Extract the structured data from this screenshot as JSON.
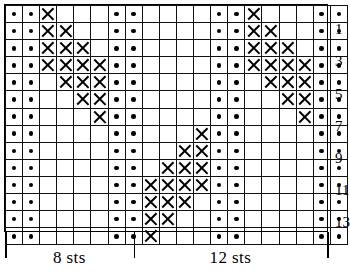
{
  "chart_data": {
    "type": "table",
    "columns": 20,
    "rows": 14,
    "symbols": {
      "dot": "purl-stitch-dot",
      "x": "knit-cross-x",
      "blank": "empty-cell"
    },
    "legend_symbols": [
      "dot",
      "x",
      "blank"
    ],
    "row_labels_side": "right",
    "row_labels": [
      "13",
      "11",
      "9",
      "7",
      "5",
      "3",
      "1"
    ],
    "row_label_rows": [
      1,
      3,
      5,
      7,
      9,
      11,
      13
    ],
    "grid": [
      [
        "dot",
        "dot",
        "x",
        "blank",
        "blank",
        "blank",
        "dot",
        "dot",
        "blank",
        "blank",
        "blank",
        "blank",
        "dot",
        "dot",
        "x",
        "blank",
        "blank",
        "blank",
        "dot",
        "dot"
      ],
      [
        "dot",
        "dot",
        "x",
        "x",
        "blank",
        "blank",
        "dot",
        "dot",
        "blank",
        "blank",
        "blank",
        "blank",
        "dot",
        "dot",
        "x",
        "x",
        "blank",
        "blank",
        "dot",
        "dot"
      ],
      [
        "dot",
        "dot",
        "x",
        "x",
        "x",
        "blank",
        "dot",
        "dot",
        "blank",
        "blank",
        "blank",
        "blank",
        "dot",
        "dot",
        "x",
        "x",
        "x",
        "blank",
        "dot",
        "dot"
      ],
      [
        "dot",
        "dot",
        "x",
        "x",
        "x",
        "x",
        "dot",
        "dot",
        "blank",
        "blank",
        "blank",
        "blank",
        "dot",
        "dot",
        "x",
        "x",
        "x",
        "x",
        "dot",
        "dot"
      ],
      [
        "dot",
        "dot",
        "blank",
        "x",
        "x",
        "x",
        "dot",
        "dot",
        "blank",
        "blank",
        "blank",
        "blank",
        "dot",
        "dot",
        "blank",
        "x",
        "x",
        "x",
        "dot",
        "dot"
      ],
      [
        "dot",
        "dot",
        "blank",
        "blank",
        "x",
        "x",
        "dot",
        "dot",
        "blank",
        "blank",
        "blank",
        "blank",
        "dot",
        "dot",
        "blank",
        "blank",
        "x",
        "x",
        "dot",
        "dot"
      ],
      [
        "dot",
        "dot",
        "blank",
        "blank",
        "blank",
        "x",
        "dot",
        "dot",
        "blank",
        "blank",
        "blank",
        "blank",
        "dot",
        "dot",
        "blank",
        "blank",
        "blank",
        "x",
        "dot",
        "dot"
      ],
      [
        "dot",
        "dot",
        "blank",
        "blank",
        "blank",
        "blank",
        "dot",
        "dot",
        "blank",
        "blank",
        "blank",
        "x",
        "dot",
        "dot",
        "blank",
        "blank",
        "blank",
        "blank",
        "dot",
        "dot"
      ],
      [
        "dot",
        "dot",
        "blank",
        "blank",
        "blank",
        "blank",
        "dot",
        "dot",
        "blank",
        "blank",
        "x",
        "x",
        "dot",
        "dot",
        "blank",
        "blank",
        "blank",
        "blank",
        "dot",
        "dot"
      ],
      [
        "dot",
        "dot",
        "blank",
        "blank",
        "blank",
        "blank",
        "dot",
        "dot",
        "blank",
        "x",
        "x",
        "x",
        "dot",
        "dot",
        "blank",
        "blank",
        "blank",
        "blank",
        "dot",
        "dot"
      ],
      [
        "dot",
        "dot",
        "blank",
        "blank",
        "blank",
        "blank",
        "dot",
        "dot",
        "x",
        "x",
        "x",
        "x",
        "dot",
        "dot",
        "blank",
        "blank",
        "blank",
        "blank",
        "dot",
        "dot"
      ],
      [
        "dot",
        "dot",
        "blank",
        "blank",
        "blank",
        "blank",
        "dot",
        "dot",
        "x",
        "x",
        "x",
        "blank",
        "dot",
        "dot",
        "blank",
        "blank",
        "blank",
        "blank",
        "dot",
        "dot"
      ],
      [
        "dot",
        "dot",
        "blank",
        "blank",
        "blank",
        "blank",
        "dot",
        "dot",
        "x",
        "x",
        "blank",
        "blank",
        "dot",
        "dot",
        "blank",
        "blank",
        "blank",
        "blank",
        "dot",
        "dot"
      ],
      [
        "dot",
        "dot",
        "blank",
        "blank",
        "blank",
        "blank",
        "dot",
        "dot",
        "x",
        "blank",
        "blank",
        "blank",
        "dot",
        "dot",
        "blank",
        "blank",
        "blank",
        "blank",
        "dot",
        "dot"
      ]
    ]
  },
  "repeats": [
    {
      "label": "8 sts",
      "start_column": 1,
      "end_column": 8
    },
    {
      "label": "12 sts",
      "start_column": 9,
      "end_column": 20
    }
  ],
  "colors": {
    "ink": "#000000",
    "grid_line": "#111111",
    "background": "#ffffff"
  }
}
